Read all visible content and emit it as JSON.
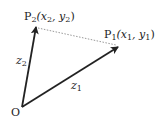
{
  "diagram": {
    "origin": {
      "label": "O"
    },
    "points": [
      {
        "id": "P1",
        "name": "P",
        "sub": "1",
        "coords": "(x",
        "coord_sub_x": "1",
        "sep": ", y",
        "coord_sub_y": "1",
        "close": ")"
      },
      {
        "id": "P2",
        "name": "P",
        "sub": "2",
        "coords": "(x",
        "coord_sub_x": "2",
        "sep": ", y",
        "coord_sub_y": "2",
        "close": ")"
      }
    ],
    "vectors": [
      {
        "label": "z",
        "sub": "1"
      },
      {
        "label": "z",
        "sub": "2"
      }
    ],
    "colors": {
      "line": "#222222",
      "dashed": "#999999"
    }
  }
}
